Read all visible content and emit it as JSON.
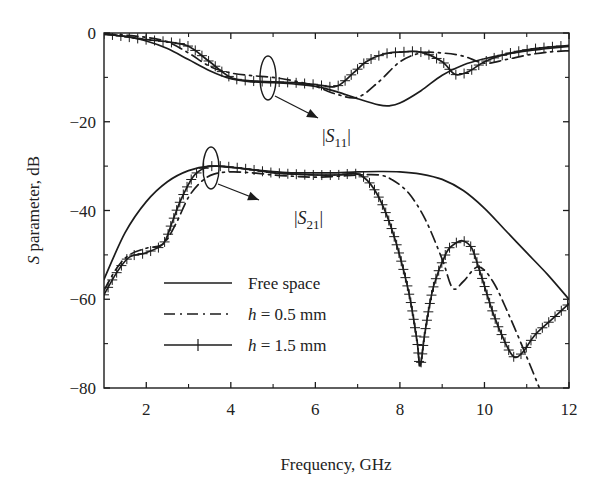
{
  "chart_data": {
    "type": "line",
    "title": "",
    "xlabel": "Frequency, GHz",
    "ylabel": "S parameter, dB",
    "ylabel_parts": {
      "italic": "S",
      "rest": " parameter, dB"
    },
    "xlim": [
      1,
      12
    ],
    "ylim": [
      -80,
      0
    ],
    "xticks": [
      2,
      4,
      6,
      8,
      10,
      12
    ],
    "xticks_minor": [
      3,
      5,
      7,
      9,
      11
    ],
    "yticks": [
      0,
      -20,
      -40,
      -60,
      -80
    ],
    "yticks_labels": [
      "0",
      "−20",
      "−40",
      "−60",
      "−80"
    ],
    "yticks_minor": [
      -10,
      -30,
      -50,
      -70
    ],
    "grid": false,
    "legend_position": "lower-left inside",
    "legend": [
      {
        "label": "Free space",
        "style": "solid"
      },
      {
        "label_italic": "h",
        "label_rest": " = 0.5 mm",
        "label": "h = 0.5 mm",
        "style": "dash-dot"
      },
      {
        "label_italic": "h",
        "label_rest": " = 1.5 mm",
        "label": "h = 1.5 mm",
        "style": "solid-with-plus-markers"
      }
    ],
    "annotations": [
      {
        "text": "|S11|",
        "italic": "S",
        "sub": "11",
        "target": "S11 curve group near 5 GHz"
      },
      {
        "text": "|S21|",
        "italic": "S",
        "sub": "21",
        "target": "S21 curve group near 4.2 GHz"
      }
    ],
    "series": [
      {
        "name": "Free space |S11|",
        "style": "solid",
        "x": [
          1,
          1.5,
          2,
          2.5,
          3,
          3.5,
          4,
          4.5,
          5,
          5.5,
          6,
          6.5,
          7,
          7.5,
          7.75,
          8,
          8.5,
          9,
          9.5,
          10,
          10.5,
          11,
          11.5,
          12
        ],
        "y": [
          -0.3,
          -0.8,
          -1.8,
          -3.5,
          -6.0,
          -8.5,
          -10.3,
          -11.0,
          -11.2,
          -11.5,
          -12.0,
          -13.2,
          -14.8,
          -16.2,
          -16.4,
          -15.8,
          -13.0,
          -9.5,
          -7.2,
          -5.8,
          -4.8,
          -4.0,
          -3.5,
          -3.0
        ]
      },
      {
        "name": "h = 0.5 mm |S11|",
        "style": "dash-dot",
        "x": [
          1,
          1.5,
          2,
          2.5,
          3,
          3.5,
          4,
          4.5,
          5,
          5.5,
          6,
          6.5,
          7,
          7.5,
          8,
          8.5,
          9,
          9.5,
          10,
          10.5,
          11,
          11.5,
          12
        ],
        "y": [
          -0.2,
          -0.5,
          -1.0,
          -2.0,
          -4.5,
          -7.5,
          -9.0,
          -9.6,
          -10.0,
          -10.8,
          -12.0,
          -13.8,
          -14.5,
          -11.0,
          -6.5,
          -4.5,
          -4.5,
          -5.2,
          -6.8,
          -6.0,
          -5.0,
          -4.3,
          -4.0
        ]
      },
      {
        "name": "h = 1.5 mm |S11|",
        "style": "solid-plus",
        "x": [
          1,
          1.5,
          2,
          2.5,
          3,
          3.5,
          4,
          4.5,
          5,
          5.5,
          6,
          6.5,
          6.9,
          7.2,
          7.6,
          8,
          8.5,
          9,
          9.3,
          9.6,
          10,
          10.5,
          11,
          11.5,
          12
        ],
        "y": [
          -0.2,
          -0.8,
          -1.5,
          -2.0,
          -3.0,
          -6.5,
          -10.0,
          -10.8,
          -11.0,
          -11.2,
          -11.6,
          -12.0,
          -9.0,
          -6.5,
          -4.8,
          -4.3,
          -4.3,
          -6.5,
          -9.3,
          -8.8,
          -6.5,
          -4.8,
          -3.8,
          -3.2,
          -2.8
        ]
      },
      {
        "name": "Free space |S21|",
        "style": "solid",
        "x": [
          1,
          1.5,
          2,
          2.5,
          3,
          3.5,
          4,
          4.5,
          5,
          5.5,
          6,
          6.5,
          7,
          7.5,
          8,
          8.5,
          9,
          9.5,
          10,
          10.5,
          11,
          11.5,
          12
        ],
        "y": [
          -55.5,
          -45,
          -38,
          -33.5,
          -31,
          -30,
          -30.3,
          -30.8,
          -31.2,
          -31.5,
          -31.5,
          -31.5,
          -31.3,
          -31.2,
          -31.3,
          -31.8,
          -33.0,
          -35.5,
          -39.5,
          -44.5,
          -49.5,
          -54.5,
          -60.0
        ]
      },
      {
        "name": "h = 0.5 mm |S21|",
        "style": "dash-dot",
        "x": [
          1,
          1.3,
          1.6,
          2,
          2.4,
          2.7,
          3,
          3.3,
          3.6,
          4,
          4.5,
          5,
          5.5,
          6,
          6.5,
          7,
          7.5,
          7.8,
          8.2,
          8.6,
          9,
          9.25,
          9.5,
          9.85,
          10.2,
          10.6,
          11,
          11.3
        ],
        "y": [
          -58,
          -53,
          -50,
          -48.5,
          -47.5,
          -43,
          -37,
          -33.5,
          -31.8,
          -31.3,
          -31.5,
          -32,
          -32.3,
          -32.5,
          -32.3,
          -32,
          -32,
          -33,
          -36,
          -42,
          -51,
          -57.5,
          -56,
          -52.7,
          -56,
          -64,
          -73,
          -80
        ]
      },
      {
        "name": "h = 1.5 mm |S21|",
        "style": "solid-plus",
        "x": [
          1,
          1.3,
          1.6,
          2,
          2.4,
          2.6,
          2.8,
          3.1,
          3.4,
          3.7,
          4,
          4.5,
          5,
          5.5,
          6,
          6.5,
          7,
          7.3,
          7.6,
          7.9,
          8.2,
          8.4,
          8.48,
          8.6,
          8.8,
          9.1,
          9.3,
          9.48,
          9.7,
          9.9,
          10.2,
          10.5,
          10.7,
          10.9,
          11.2,
          11.6,
          12
        ],
        "y": [
          -59,
          -54,
          -50.5,
          -49.5,
          -47.5,
          -43,
          -38,
          -32.5,
          -30.3,
          -30,
          -30.2,
          -30.8,
          -31.5,
          -31.8,
          -32,
          -32,
          -31.8,
          -34,
          -39,
          -47,
          -58,
          -69,
          -75,
          -67,
          -57,
          -49.5,
          -47.5,
          -46.8,
          -48.5,
          -54,
          -63,
          -70,
          -73,
          -72,
          -68,
          -64.5,
          -61
        ]
      }
    ]
  },
  "page": {
    "legend_labels": [
      "Free space",
      "h",
      " = 0.5 mm",
      "h",
      " = 1.5 mm"
    ]
  }
}
